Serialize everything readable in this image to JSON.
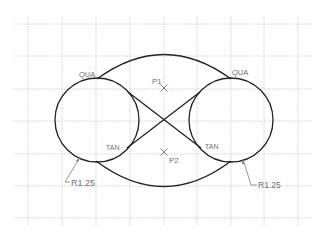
{
  "drawing": {
    "grid": {
      "x_lines": [
        28,
        62,
        96,
        130,
        164,
        197,
        231,
        264,
        298
      ],
      "y_lines": [
        24,
        56,
        89,
        121,
        154,
        186,
        218
      ],
      "x_extent": [
        14,
        312
      ],
      "y_extent": [
        16,
        226
      ],
      "color": "#c8c8c8"
    },
    "circles": [
      {
        "name": "left-circle",
        "cx": 97,
        "cy": 120,
        "r": 42
      },
      {
        "name": "right-circle",
        "cx": 231,
        "cy": 120,
        "r": 42
      }
    ],
    "labels": {
      "qua_left": "QUA",
      "qua_right": "QUA",
      "tan_left": "TAN",
      "tan_right": "TAN",
      "p1": "P1",
      "p2": "P2",
      "radius_left": "R1.25",
      "radius_right": "R1.25"
    },
    "colors": {
      "geometry": "#222222",
      "annotation": "#6f6f6f",
      "background": "#ffffff"
    }
  }
}
